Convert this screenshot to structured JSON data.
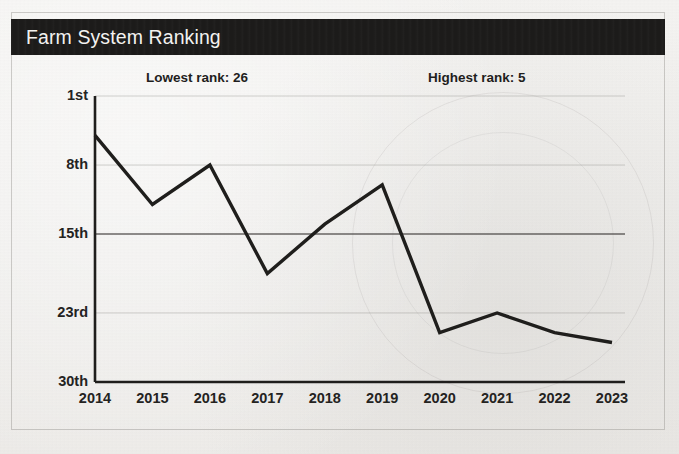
{
  "header": {
    "title": "Farm System Ranking",
    "bar_color": "#1c1b1a",
    "text_color": "#f3f2f0"
  },
  "annotations": {
    "lowest": "Lowest rank: 26",
    "highest": "Highest rank: 5"
  },
  "axis": {
    "y_ticks": [
      "1st",
      "8th",
      "15th",
      "23rd",
      "30th"
    ],
    "y_tick_values": [
      1,
      8,
      15,
      23,
      30
    ],
    "x_ticks": [
      "2014",
      "2015",
      "2016",
      "2017",
      "2018",
      "2019",
      "2020",
      "2021",
      "2022",
      "2023"
    ]
  },
  "chart_data": {
    "type": "line",
    "title": "Farm System Ranking",
    "xlabel": "",
    "ylabel": "",
    "x": [
      "2014",
      "2015",
      "2016",
      "2017",
      "2018",
      "2019",
      "2020",
      "2021",
      "2022",
      "2023"
    ],
    "categories": [
      "2014",
      "2015",
      "2016",
      "2017",
      "2018",
      "2019",
      "2020",
      "2021",
      "2022",
      "2023"
    ],
    "values": [
      5,
      12,
      8,
      19,
      14,
      10,
      25,
      23,
      25,
      26
    ],
    "series": [
      {
        "name": "Farm System Ranking",
        "values": [
          5,
          12,
          8,
          19,
          14,
          10,
          25,
          23,
          25,
          26
        ],
        "color": "#1f1e1c"
      }
    ],
    "ylim": [
      1,
      30
    ],
    "y_inverted": true,
    "ytick_labels": [
      "1st",
      "8th",
      "15th",
      "23rd",
      "30th"
    ],
    "ytick_values": [
      1,
      8,
      15,
      23,
      30
    ],
    "grid": true,
    "grid_emphasis_value": 15,
    "legend": "none",
    "annotations": [
      {
        "text": "Lowest rank: 26",
        "value": 26
      },
      {
        "text": "Highest rank: 5",
        "value": 5
      }
    ],
    "line_color": "#1f1e1c",
    "line_width": 3.4,
    "background": "#f1f0ee"
  }
}
